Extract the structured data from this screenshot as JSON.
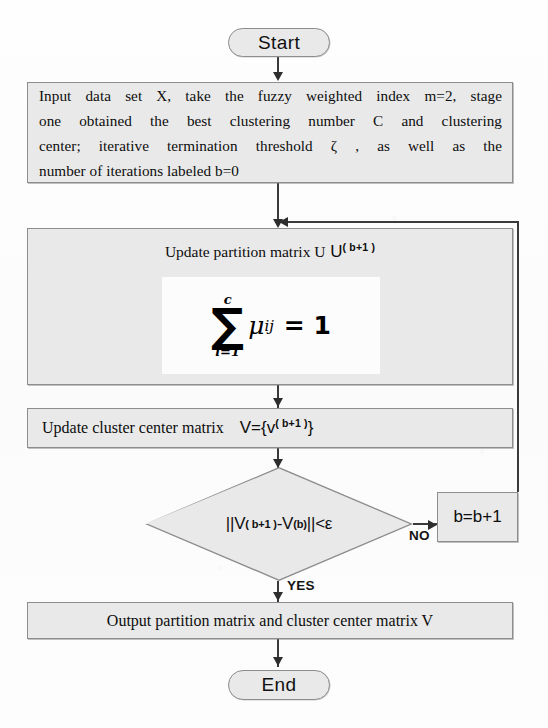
{
  "diagram": {
    "type": "flowchart",
    "colors": {
      "node_fill": "#e9e9e9",
      "node_border": "#8d8d8d",
      "connector": "#3a3a3a",
      "formula_plate": "#fcfcfc",
      "page_background": "#fdfdfd",
      "text": "#0d0d0d"
    }
  },
  "nodes": {
    "start": {
      "shape": "terminator",
      "label": "Start"
    },
    "input": {
      "shape": "process",
      "lines": [
        "Input data set X, take the fuzzy weighted index m=2, stage",
        "one obtained the best clustering number C and clustering",
        "center; iterative termination threshold  ζ , as well as the",
        "number of iterations labeled b=0"
      ],
      "full_text": "Input data set X, take the fuzzy weighted index m=2, stage one obtained the best clustering number C and clustering center; iterative termination threshold ζ , as well as the number of iterations labeled b=0"
    },
    "update_u": {
      "shape": "process",
      "label_main": "Update partition matrix U",
      "label_sup": "( b+1 )",
      "formula": {
        "sum_upper": "c",
        "sum_lower": "i=1",
        "sigma": "∑",
        "term": "μ",
        "term_sub": "ij",
        "equals": "= 1",
        "plain": "∑(i=1..c) μ_ij = 1"
      }
    },
    "update_v": {
      "shape": "process",
      "label_main": "Update cluster center matrix",
      "label_v": "V={v",
      "label_sup": "( b+1 )",
      "label_close": "}",
      "plain": "Update cluster center matrix   V={v^(b+1) }"
    },
    "decision": {
      "shape": "diamond",
      "text_a": "||V",
      "sup_a": "( b+1 )",
      "text_b": " -V",
      "sup_b": "(b)",
      "text_c": "||<ε",
      "plain": "||V^(b+1) -V^(b)||<ε"
    },
    "increment": {
      "shape": "process",
      "label": "b=b+1"
    },
    "output": {
      "shape": "process",
      "label": "Output partition matrix and cluster center matrix  V"
    },
    "end": {
      "shape": "terminator",
      "label": "End"
    }
  },
  "edges": {
    "no_label": "NO",
    "yes_label": "YES"
  }
}
